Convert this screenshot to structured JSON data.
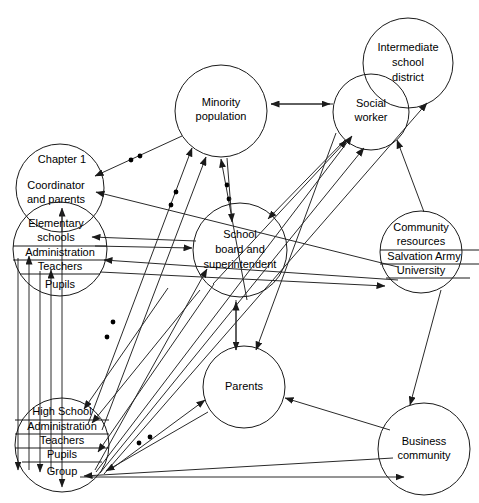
{
  "diagram": {
    "type": "node-link-network",
    "stroke_color": "#1a1a1a",
    "background": "#ffffff",
    "nodes": [
      {
        "id": "minority-population",
        "label_lines": [
          "Minority",
          "population"
        ],
        "cx": 221,
        "cy": 111,
        "r": 46,
        "sub_rows": []
      },
      {
        "id": "intermediate-school-district",
        "label_lines": [
          "Intermediate",
          "school",
          "district"
        ],
        "cx": 408,
        "cy": 63,
        "r": 45,
        "sub_rows": []
      },
      {
        "id": "social-worker",
        "label_lines": [
          "Social",
          "worker"
        ],
        "cx": 371,
        "cy": 112,
        "r": 38,
        "sub_rows": []
      },
      {
        "id": "chapter-1",
        "label_lines": [
          "Chapter 1",
          "Coordinator",
          "and parents"
        ],
        "cx": 60,
        "cy": 188,
        "r": 44,
        "sub_rows": []
      },
      {
        "id": "elementary-schools",
        "label_lines": [
          "Elementary",
          "schools"
        ],
        "cx": 60,
        "cy": 249,
        "r": 47,
        "sub_rows": [
          "Administration",
          "Teachers",
          "Pupils"
        ]
      },
      {
        "id": "school-board",
        "label_lines": [
          "School",
          "board and",
          "superintendent"
        ],
        "cx": 240,
        "cy": 250,
        "r": 47,
        "sub_rows": []
      },
      {
        "id": "community-resources",
        "label_lines": [
          "Community",
          "resources"
        ],
        "cx": 421,
        "cy": 252,
        "r": 41,
        "sub_rows": [
          "Salvation Army",
          "University"
        ]
      },
      {
        "id": "parents",
        "label_lines": [
          "Parents"
        ],
        "cx": 244,
        "cy": 387,
        "r": 41,
        "sub_rows": []
      },
      {
        "id": "high-school",
        "label_lines": [
          "High School"
        ],
        "cx": 62,
        "cy": 445,
        "r": 47,
        "sub_rows": [
          "Administration",
          "Teachers",
          "Pupils",
          "Group"
        ]
      },
      {
        "id": "business-community",
        "label_lines": [
          "Business",
          "community"
        ],
        "cx": 424,
        "cy": 449,
        "r": 46,
        "sub_rows": []
      }
    ],
    "edges": [
      {
        "from": "social-worker",
        "to": "minority-population",
        "style": "solid"
      },
      {
        "from": "minority-population",
        "to": "chapter-1",
        "style": "dotted-marker"
      },
      {
        "from": "chapter-1",
        "to": "minority-population",
        "style": "solid"
      },
      {
        "from": "high-school",
        "to": "minority-population",
        "style": "solid"
      },
      {
        "from": "elementary-schools",
        "to": "minority-population",
        "style": "dotted-marker"
      },
      {
        "from": "school-board",
        "to": "minority-population",
        "style": "dotted-marker"
      },
      {
        "from": "minority-population",
        "to": "school-board",
        "style": "solid"
      },
      {
        "from": "social-worker",
        "to": "school-board",
        "style": "solid"
      },
      {
        "from": "school-board",
        "to": "elementary-schools",
        "style": "solid"
      },
      {
        "from": "community-resources",
        "to": "chapter-1",
        "style": "solid"
      },
      {
        "from": "community-resources",
        "to": "elementary-schools",
        "style": "solid"
      },
      {
        "from": "elementary-schools",
        "to": "university",
        "style": "solid"
      },
      {
        "from": "school-board",
        "to": "social-worker",
        "style": "solid"
      },
      {
        "from": "high-school",
        "to": "social-worker",
        "style": "solid"
      },
      {
        "from": "high-school",
        "to": "intermediate-school-district",
        "style": "solid"
      },
      {
        "from": "community-resources",
        "to": "intermediate-school-district",
        "style": "solid"
      },
      {
        "from": "school-board",
        "to": "parents",
        "style": "solid"
      },
      {
        "from": "parents",
        "to": "school-board",
        "style": "solid"
      },
      {
        "from": "social-worker",
        "to": "parents",
        "style": "solid"
      },
      {
        "from": "high-school",
        "to": "parents",
        "style": "solid"
      },
      {
        "from": "business-community",
        "to": "parents",
        "style": "solid"
      },
      {
        "from": "community-resources",
        "to": "business-community",
        "style": "solid"
      },
      {
        "from": "high-school-group",
        "to": "business-community",
        "style": "solid"
      },
      {
        "from": "high-school-group",
        "to": "school-board",
        "style": "dotted-marker"
      },
      {
        "from": "elementary-administration",
        "to": "high-school",
        "style": "solid"
      },
      {
        "from": "elementary-teachers",
        "to": "high-school",
        "style": "solid"
      },
      {
        "from": "chapter-1",
        "to": "high-school",
        "style": "solid"
      }
    ]
  }
}
